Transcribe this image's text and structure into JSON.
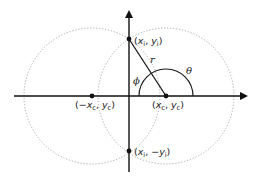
{
  "diagram": {
    "type": "geometry",
    "colors": {
      "axis": "#111111",
      "circle": "#a8a8a8",
      "line": "#1a1a1a",
      "point": "#111111",
      "text": "#222222"
    },
    "labels": {
      "top_point": "(x_i, y_i)",
      "bottom_point": "(x_i, −y_i)",
      "left_center": "(−x_c, y_c)",
      "right_center": "(x_c, y_c)",
      "radius": "r",
      "theta": "θ",
      "phi": "ϕ"
    },
    "text": {
      "top_point": {
        "open": "(",
        "x": "x",
        "xsub": "i",
        "sep": ", ",
        "y": "y",
        "ysub": "i",
        "close": ")"
      },
      "bottom_point": {
        "open": "(",
        "x": "x",
        "xsub": "i",
        "sep": ", −",
        "y": "y",
        "ysub": "i",
        "close": ")"
      },
      "left_center": {
        "open": "(−",
        "x": "x",
        "xsub": "c",
        "sep": ", ",
        "y": "y",
        "ysub": "c",
        "close": ")"
      },
      "right_center": {
        "open": "(",
        "x": "x",
        "xsub": "c",
        "sep": ", ",
        "y": "y",
        "ysub": "c",
        "close": ")"
      },
      "radius": "r",
      "theta": "θ",
      "phi": "ϕ"
    }
  }
}
